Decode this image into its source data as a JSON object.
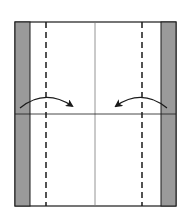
{
  "diagram": {
    "type": "origami-fold-step",
    "colors": {
      "background": "#ffffff",
      "paper_front": "#ffffff",
      "paper_back": "#9a9a9a",
      "line": "#1a1a1a",
      "crease": "#7a7a7a"
    },
    "paper": {
      "x": 15,
      "y": 22,
      "width": 161,
      "height": 184
    },
    "gray_strips": [
      {
        "name": "left-colored-edge",
        "x": 15,
        "width": 15
      },
      {
        "name": "right-colored-edge",
        "x": 161,
        "width": 15
      }
    ],
    "valley_fold_lines": [
      {
        "name": "left-valley-fold",
        "x": 46
      },
      {
        "name": "right-valley-fold",
        "x": 142
      }
    ],
    "crease_lines": {
      "vertical_center_x": 95,
      "horizontal_y": 114
    },
    "arrows": [
      {
        "name": "fold-left-edge-in",
        "direction": "right",
        "start": [
          20,
          108
        ],
        "control": [
          45,
          88
        ],
        "end": [
          72,
          106
        ]
      },
      {
        "name": "fold-right-edge-in",
        "direction": "left",
        "start": [
          167,
          108
        ],
        "control": [
          142,
          88
        ],
        "end": [
          116,
          106
        ]
      }
    ]
  }
}
